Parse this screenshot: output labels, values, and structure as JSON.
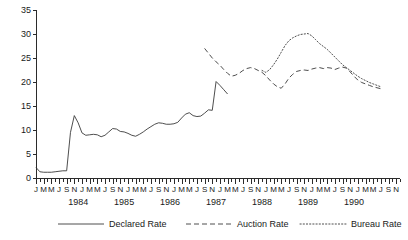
{
  "chart_data": {
    "type": "line",
    "title": "",
    "xlabel": "",
    "ylabel": "Inflation-adjusted value of the cedi",
    "ylim": [
      0,
      35
    ],
    "yticks": [
      0,
      5,
      10,
      15,
      20,
      25,
      30,
      35
    ],
    "grid": false,
    "legend_position": "bottom",
    "x_tick_labels": [
      "J",
      "M",
      "M",
      "J",
      "S",
      "N"
    ],
    "x_minor_ticks_per_year": 12,
    "year_labels": [
      "1983",
      "1984",
      "1985",
      "1986",
      "1987",
      "1988",
      "1989",
      "1990"
    ],
    "x_start_label": "J",
    "x_range_start": "1983-01",
    "x_range_end": "1990-07",
    "series": [
      {
        "name": "Declared Rate",
        "style": "solid",
        "color": "#3a3a3a",
        "x": [
          "1983-01",
          "1983-02",
          "1983-03",
          "1983-04",
          "1983-05",
          "1983-06",
          "1983-07",
          "1983-08",
          "1983-09",
          "1983-10",
          "1983-11",
          "1983-12",
          "1984-01",
          "1984-02",
          "1984-03",
          "1984-04",
          "1984-05",
          "1984-06",
          "1984-07",
          "1984-08",
          "1984-09",
          "1984-10",
          "1984-11",
          "1984-12",
          "1985-01",
          "1985-02",
          "1985-03",
          "1985-04",
          "1985-05",
          "1985-06",
          "1985-07",
          "1985-08",
          "1985-09",
          "1985-10",
          "1985-11",
          "1985-12",
          "1986-01",
          "1986-02",
          "1986-03",
          "1986-04",
          "1986-05",
          "1986-06",
          "1986-07",
          "1986-08",
          "1986-09",
          "1986-10",
          "1986-11",
          "1986-12",
          "1987-01",
          "1987-02",
          "1987-03"
        ],
        "values": [
          2.2,
          1.3,
          1.2,
          1.2,
          1.2,
          1.3,
          1.4,
          1.5,
          1.5,
          9.5,
          13.0,
          11.5,
          9.4,
          8.9,
          9.0,
          9.1,
          9.0,
          8.6,
          8.9,
          9.6,
          10.3,
          10.2,
          9.7,
          9.6,
          9.3,
          8.9,
          8.7,
          9.1,
          9.6,
          10.2,
          10.7,
          11.2,
          11.5,
          11.4,
          11.2,
          11.2,
          11.3,
          11.6,
          12.5,
          13.3,
          13.6,
          13.0,
          12.8,
          12.9,
          13.5,
          14.2,
          14.1,
          20.1,
          19.3,
          18.4,
          17.5
        ]
      },
      {
        "name": "Auction Rate",
        "style": "dashed",
        "color": "#3a3a3a",
        "x": [
          "1986-09",
          "1986-10",
          "1986-11",
          "1986-12",
          "1987-01",
          "1987-02",
          "1987-03",
          "1987-04",
          "1987-05",
          "1987-06",
          "1987-07",
          "1987-08",
          "1987-09",
          "1987-10",
          "1987-11",
          "1987-12",
          "1988-01",
          "1988-02",
          "1988-03",
          "1988-04",
          "1988-05",
          "1988-06",
          "1988-07",
          "1988-08",
          "1988-09",
          "1988-10",
          "1988-11",
          "1988-12",
          "1989-01",
          "1989-02",
          "1989-03",
          "1989-04",
          "1989-05",
          "1989-06",
          "1989-07",
          "1989-08",
          "1989-09",
          "1989-10",
          "1989-11",
          "1989-12",
          "1990-01",
          "1990-02",
          "1990-03",
          "1990-04",
          "1990-05",
          "1990-06",
          "1990-07"
        ],
        "values": [
          27.0,
          26.0,
          25.0,
          24.2,
          23.5,
          22.6,
          21.8,
          21.2,
          21.4,
          21.8,
          22.4,
          22.8,
          23.0,
          22.8,
          22.4,
          22.0,
          21.3,
          20.4,
          19.6,
          19.0,
          18.7,
          19.6,
          20.8,
          21.6,
          22.2,
          22.4,
          22.5,
          22.4,
          22.7,
          22.9,
          23.0,
          22.8,
          23.0,
          22.9,
          22.6,
          22.9,
          23.1,
          22.9,
          22.1,
          21.2,
          20.4,
          19.9,
          19.6,
          19.3,
          19.0,
          18.8,
          18.6
        ]
      },
      {
        "name": "Bureau Rate",
        "style": "dotted",
        "color": "#3a3a3a",
        "x": [
          "1987-12",
          "1988-01",
          "1988-02",
          "1988-03",
          "1988-04",
          "1988-05",
          "1988-06",
          "1988-07",
          "1988-08",
          "1988-09",
          "1988-10",
          "1988-11",
          "1988-12",
          "1989-01",
          "1989-02",
          "1989-03",
          "1989-04",
          "1989-05",
          "1989-06",
          "1989-07",
          "1989-08",
          "1989-09",
          "1989-10",
          "1989-11",
          "1989-12",
          "1990-01",
          "1990-02",
          "1990-03",
          "1990-04",
          "1990-05",
          "1990-06",
          "1990-07"
        ],
        "values": [
          22.4,
          22.0,
          22.6,
          23.6,
          24.8,
          26.2,
          27.6,
          28.6,
          29.2,
          29.6,
          29.9,
          30.0,
          30.1,
          29.6,
          28.8,
          28.0,
          27.4,
          26.8,
          26.0,
          25.2,
          24.4,
          23.6,
          23.0,
          22.4,
          21.8,
          21.2,
          20.7,
          20.3,
          19.9,
          19.6,
          19.3,
          19.0
        ]
      }
    ]
  },
  "legend": {
    "items": [
      {
        "label": "Declared Rate",
        "style": "solid"
      },
      {
        "label": "Auction Rate",
        "style": "dashed"
      },
      {
        "label": "Bureau Rate",
        "style": "dotted"
      }
    ]
  }
}
